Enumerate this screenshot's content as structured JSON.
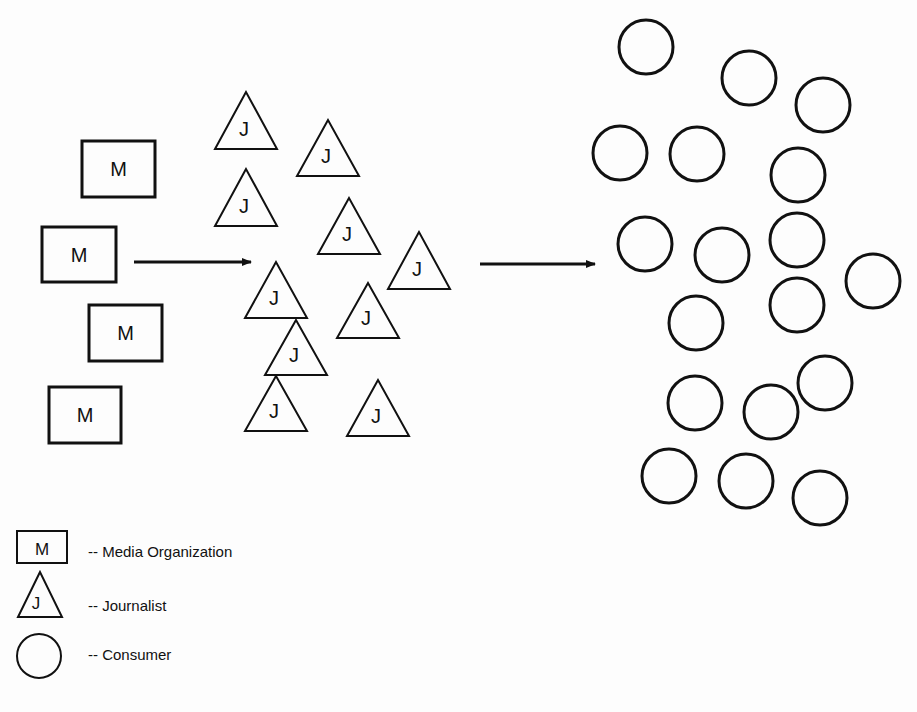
{
  "diagram": {
    "type": "flow",
    "media_organizations": {
      "label": "M",
      "items": [
        {
          "x": 82,
          "y": 141,
          "w": 73,
          "h": 56
        },
        {
          "x": 42,
          "y": 227,
          "w": 74,
          "h": 55
        },
        {
          "x": 89,
          "y": 305,
          "w": 73,
          "h": 56
        },
        {
          "x": 49,
          "y": 387,
          "w": 72,
          "h": 56
        }
      ]
    },
    "journalists": {
      "label": "J",
      "items": [
        {
          "ax": 246,
          "ay": 92,
          "base": 149,
          "half": 31
        },
        {
          "ax": 328,
          "ay": 120,
          "base": 176,
          "half": 31
        },
        {
          "ax": 246,
          "ay": 169,
          "base": 226,
          "half": 31
        },
        {
          "ax": 349,
          "ay": 198,
          "base": 254,
          "half": 31
        },
        {
          "ax": 419,
          "ay": 232,
          "base": 289,
          "half": 31
        },
        {
          "ax": 276,
          "ay": 262,
          "base": 318,
          "half": 31
        },
        {
          "ax": 368,
          "ay": 283,
          "base": 338,
          "half": 31
        },
        {
          "ax": 296,
          "ay": 320,
          "base": 375,
          "half": 31
        },
        {
          "ax": 276,
          "ay": 376,
          "base": 431,
          "half": 31
        },
        {
          "ax": 378,
          "ay": 380,
          "base": 436,
          "half": 31
        }
      ]
    },
    "consumers": {
      "radius": 27,
      "items": [
        {
          "cx": 646,
          "cy": 47
        },
        {
          "cx": 749,
          "cy": 78
        },
        {
          "cx": 823,
          "cy": 105
        },
        {
          "cx": 620,
          "cy": 153
        },
        {
          "cx": 697,
          "cy": 154
        },
        {
          "cx": 798,
          "cy": 175
        },
        {
          "cx": 645,
          "cy": 244
        },
        {
          "cx": 722,
          "cy": 255
        },
        {
          "cx": 797,
          "cy": 240
        },
        {
          "cx": 873,
          "cy": 281
        },
        {
          "cx": 696,
          "cy": 323
        },
        {
          "cx": 797,
          "cy": 305
        },
        {
          "cx": 695,
          "cy": 403
        },
        {
          "cx": 771,
          "cy": 412
        },
        {
          "cx": 825,
          "cy": 383
        },
        {
          "cx": 669,
          "cy": 476
        },
        {
          "cx": 746,
          "cy": 481
        },
        {
          "cx": 820,
          "cy": 498
        }
      ]
    },
    "arrows": [
      {
        "from": "media_organizations",
        "to": "journalists",
        "x1": 134,
        "x2": 251,
        "y": 262
      },
      {
        "from": "journalists",
        "to": "consumers",
        "x1": 480,
        "x2": 595,
        "y": 264
      }
    ]
  },
  "legend": {
    "items": [
      {
        "symbol": "square",
        "symbol_label": "M",
        "text": "-- Media Organization"
      },
      {
        "symbol": "triangle",
        "symbol_label": "J",
        "text": "-- Journalist"
      },
      {
        "symbol": "circle",
        "symbol_label": "",
        "text": "-- Consumer"
      }
    ]
  },
  "colors": {
    "stroke": "#111111",
    "background": "#fdfdfd"
  }
}
